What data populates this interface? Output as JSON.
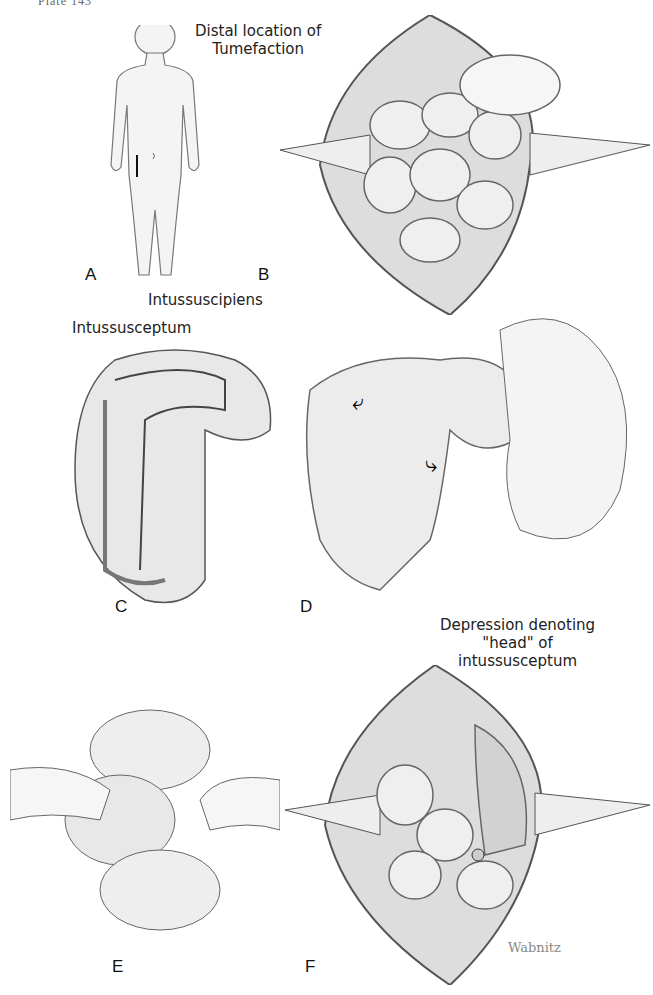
{
  "plate": {
    "header": "Plate 143"
  },
  "panels": [
    {
      "letter": "A",
      "description": "child-figure-with-right-paramedian-incision"
    },
    {
      "letter": "B",
      "description": "opened-abdomen-small-bowel-retracted",
      "labels": [
        "Distal location of",
        "Tumefaction"
      ]
    },
    {
      "letter": "C",
      "description": "longitudinal-section-of-intussusception",
      "labels": [
        "Intussuscipiens",
        "Intussusceptum"
      ]
    },
    {
      "letter": "D",
      "description": "manual-reduction-by-squeezing",
      "arrows": [
        "curved-arrow-left",
        "curved-arrow-down"
      ]
    },
    {
      "letter": "E",
      "description": "two-hands-milking-bowel"
    },
    {
      "letter": "F",
      "description": "opened-abdomen-after-reduction",
      "labels": [
        "Depression denoting",
        "\"head\" of",
        "intussusceptum"
      ]
    }
  ],
  "signature": "Wabnitz",
  "colors": {
    "ink": "#222222",
    "tissue": "#e6e6e6",
    "shadow": "#9a9a9a"
  }
}
